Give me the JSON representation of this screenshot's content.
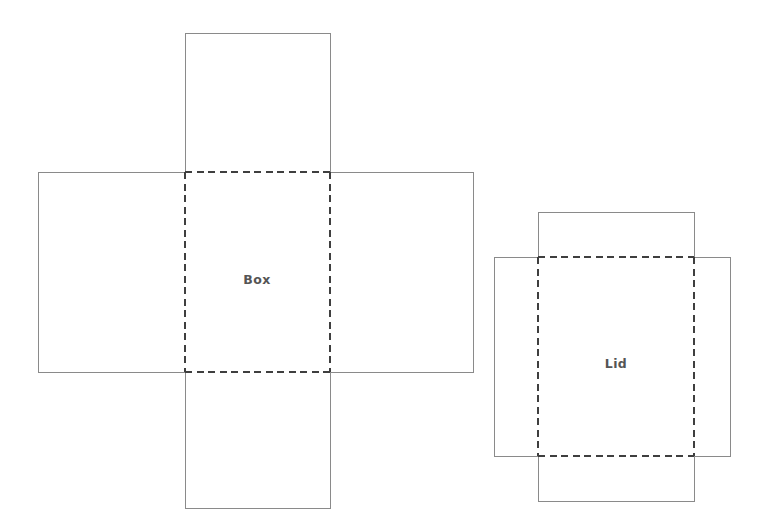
{
  "document": {
    "title": "Box and Lid Nets",
    "background_color": "#ffffff",
    "width": 769,
    "height": 526
  },
  "style": {
    "cut_line_color": "#8a8a8a",
    "fold_line_color": "#3f3f3f",
    "label_color": "#555555",
    "face_fill": "#ffffff",
    "cut_line_width": 1,
    "fold_line_width": 1.15,
    "fold_dash_pattern": "7 4.5"
  },
  "nets": [
    {
      "id": "box",
      "label": "Box",
      "label_x": 257,
      "label_y": 280,
      "base_panel": {
        "x": 185,
        "y": 172,
        "width": 145,
        "height": 200
      },
      "flaps": [
        {
          "id": "box-flap-top",
          "name": "top",
          "x": 185,
          "y": 33,
          "width": 145,
          "height": 139
        },
        {
          "id": "box-flap-bottom",
          "name": "bottom",
          "x": 185,
          "y": 372,
          "width": 145,
          "height": 136
        },
        {
          "id": "box-flap-left",
          "name": "left",
          "x": 38,
          "y": 172,
          "width": 147,
          "height": 200
        },
        {
          "id": "box-flap-right",
          "name": "right",
          "x": 330,
          "y": 172,
          "width": 143,
          "height": 200
        }
      ],
      "fold_lines": [
        {
          "id": "box-fold-top",
          "x1": 185,
          "y1": 172,
          "x2": 330,
          "y2": 172
        },
        {
          "id": "box-fold-bottom",
          "x1": 185,
          "y1": 372,
          "x2": 330,
          "y2": 372
        },
        {
          "id": "box-fold-left",
          "x1": 185,
          "y1": 172,
          "x2": 185,
          "y2": 372
        },
        {
          "id": "box-fold-right",
          "x1": 330,
          "y1": 172,
          "x2": 330,
          "y2": 372
        }
      ],
      "cut_outline": "M 185 33 L 330 33 L 330 172 L 473 172 L 473 372 L 330 372 L 330 508 L 185 508 L 185 372 L 38 372 L 38 172 L 185 172 Z"
    },
    {
      "id": "lid",
      "label": "Lid",
      "label_x": 616,
      "label_y": 364,
      "base_panel": {
        "x": 538,
        "y": 257,
        "width": 156,
        "height": 199
      },
      "flaps": [
        {
          "id": "lid-flap-top",
          "name": "top",
          "x": 538,
          "y": 212,
          "width": 156,
          "height": 45
        },
        {
          "id": "lid-flap-bottom",
          "name": "bottom",
          "x": 538,
          "y": 456,
          "width": 156,
          "height": 45
        },
        {
          "id": "lid-flap-left",
          "name": "left",
          "x": 494,
          "y": 257,
          "width": 44,
          "height": 199
        },
        {
          "id": "lid-flap-right",
          "name": "right",
          "x": 694,
          "y": 257,
          "width": 36,
          "height": 199
        }
      ],
      "fold_lines": [
        {
          "id": "lid-fold-top",
          "x1": 538,
          "y1": 257,
          "x2": 694,
          "y2": 257
        },
        {
          "id": "lid-fold-bottom",
          "x1": 538,
          "y1": 456,
          "x2": 694,
          "y2": 456
        },
        {
          "id": "lid-fold-left",
          "x1": 538,
          "y1": 257,
          "x2": 538,
          "y2": 456
        },
        {
          "id": "lid-fold-right",
          "x1": 694,
          "y1": 257,
          "x2": 694,
          "y2": 456
        }
      ],
      "cut_outline": "M 538 212 L 694 212 L 694 257 L 730 257 L 730 456 L 694 456 L 694 501 L 538 501 L 538 456 L 494 456 L 494 257 L 538 257 Z"
    }
  ]
}
